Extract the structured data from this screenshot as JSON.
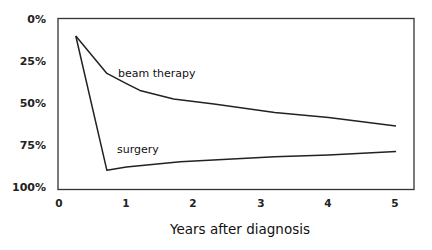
{
  "chart_data": {
    "type": "line",
    "title": "",
    "xlabel": "Years after diagnosis",
    "ylabel": "",
    "xlim": [
      0,
      5.3
    ],
    "ylim": [
      0,
      100
    ],
    "y_inverted": true,
    "grid": false,
    "legend": "inline labels",
    "x_ticks": [
      "0",
      "1",
      "2",
      "3",
      "4",
      "5"
    ],
    "y_ticks": [
      "0%",
      "25%",
      "50%",
      "75%",
      "100%"
    ],
    "series": [
      {
        "name": "beam therapy",
        "x": [
          0.25,
          0.71,
          1.0,
          1.2,
          1.7,
          2.3,
          3.2,
          4.0,
          5.0
        ],
        "values": [
          10,
          32,
          38,
          42,
          47,
          50,
          55,
          58,
          63
        ]
      },
      {
        "name": "surgery",
        "x": [
          0.25,
          0.71,
          1.0,
          1.8,
          3.2,
          4.0,
          5.0
        ],
        "values": [
          10,
          89,
          87,
          84,
          81,
          80,
          78
        ]
      }
    ]
  },
  "labels": {
    "y_ticks": [
      "0%",
      "25%",
      "50%",
      "75%",
      "100%"
    ],
    "x_ticks": [
      "0",
      "1",
      "2",
      "3",
      "4",
      "5"
    ],
    "x_axis_title": "Years after diagnosis",
    "series_beam": "beam therapy",
    "series_surgery": "surgery"
  }
}
